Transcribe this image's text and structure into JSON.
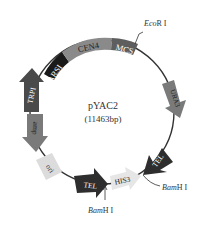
{
  "plasmid": {
    "name": "pYAC2",
    "size": "(11463bp)"
  },
  "features": [
    {
      "id": "cen4",
      "label": "CEN4",
      "color": "#8a8a8a",
      "type": "block"
    },
    {
      "id": "ars1",
      "label": "ARSI",
      "color": "#1a1a1a",
      "type": "block"
    },
    {
      "id": "mcs",
      "label": "MCS",
      "color": "#5e5e5e",
      "type": "block"
    },
    {
      "id": "trp1",
      "label": "TRPI",
      "color": "#4a4a4a",
      "type": "arrow"
    },
    {
      "id": "amp",
      "label": "amp",
      "color": "#7a7a7a",
      "type": "arrow"
    },
    {
      "id": "ori",
      "label": "ori",
      "color": "#dcdcdc",
      "type": "block"
    },
    {
      "id": "tel_left",
      "label": "TEL",
      "color": "#2e2e2e",
      "type": "arrow"
    },
    {
      "id": "his3",
      "label": "HIS3",
      "color": "#e6e6e6",
      "type": "arrow"
    },
    {
      "id": "tel_right",
      "label": "TEL",
      "color": "#2e2e2e",
      "type": "arrow"
    },
    {
      "id": "ura3",
      "label": "URA3",
      "color": "#7a7a7a",
      "type": "arrow"
    }
  ],
  "sites": {
    "ecori": {
      "italic": "Eco",
      "rest": "R I"
    },
    "bamhi_right": {
      "italic": "Bam",
      "rest": "H I"
    },
    "bamhi_bottom": {
      "italic": "Bam",
      "rest": "H I"
    }
  },
  "colors": {
    "backbone": "#333333",
    "text_dark": "#222222",
    "text_light": "#ffffff"
  }
}
